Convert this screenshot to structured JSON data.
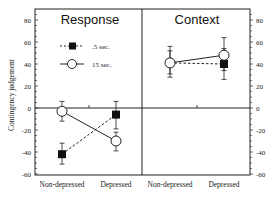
{
  "chart_data": {
    "type": "line",
    "ylabel": "Contingency judgement",
    "ylim": [
      -60,
      90
    ],
    "yticks": [
      -60,
      -40,
      -20,
      0,
      20,
      40,
      60,
      80
    ],
    "legend": {
      "position": "upper-left of Response panel",
      "entries": [
        {
          "label": ".5 sec.",
          "marker": "filled-square",
          "line": "dashed"
        },
        {
          "label": "15 sec.",
          "marker": "open-circle",
          "line": "solid"
        }
      ]
    },
    "panels": [
      {
        "title": "Response",
        "categories": [
          "Non-depressed",
          "Depressed"
        ],
        "series": [
          {
            "name": ".5 sec.",
            "values": [
              -42,
              -6
            ],
            "error_upper": [
              -32,
              6
            ],
            "error_lower": [
              -51,
              -19
            ]
          },
          {
            "name": "15 sec.",
            "values": [
              -3,
              -30
            ],
            "error_upper": [
              6,
              -22
            ],
            "error_lower": [
              -12,
              -39
            ]
          }
        ]
      },
      {
        "title": "Context",
        "categories": [
          "Non-depressed",
          "Depressed"
        ],
        "series": [
          {
            "name": ".5 sec.",
            "values": [
              41,
              40
            ],
            "error_upper": [
              52,
              54
            ],
            "error_lower": [
              31,
              34
            ]
          },
          {
            "name": "15 sec.",
            "values": [
              41,
              48
            ],
            "error_upper": [
              56,
              64
            ],
            "error_lower": [
              28,
              26
            ]
          }
        ]
      }
    ],
    "grid": false,
    "zero_line": true
  },
  "labels": {
    "panel1_title": "Response",
    "panel2_title": "Context",
    "ylabel": "Contingency judgement",
    "cat1": "Non-depressed",
    "cat2": "Depressed",
    "legend1": ".5 sec.",
    "legend2": "15 sec.",
    "ticks": [
      "80",
      "60",
      "40",
      "20",
      "0",
      "-20",
      "-40",
      "-60"
    ]
  }
}
